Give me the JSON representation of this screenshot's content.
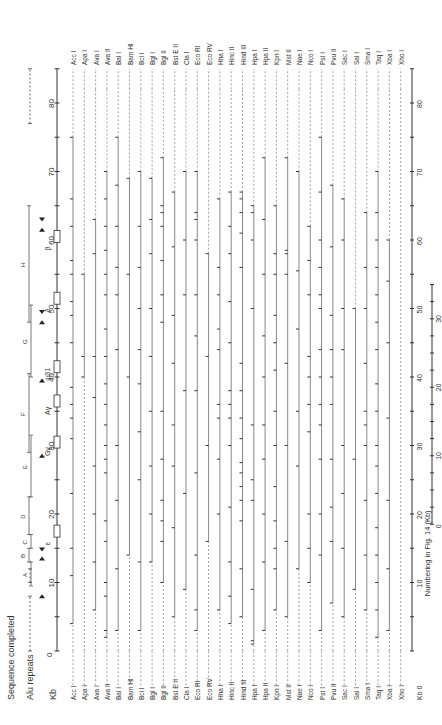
{
  "chart_data": {
    "type": "restriction_map",
    "orientation": "rotated-90-ccw",
    "title": "",
    "legend": {
      "sequence_completed": "Sequence completed",
      "alu_repeats": "Alu repeats"
    },
    "main_axis": {
      "label": "Kb",
      "zero_label": "0",
      "range": [
        0,
        85
      ],
      "ticks": [
        0,
        5,
        10,
        15,
        20,
        25,
        30,
        35,
        40,
        45,
        50,
        55,
        60,
        65,
        70,
        75,
        80,
        85
      ],
      "tick_labels": [
        "10",
        "20",
        "30",
        "40",
        "50",
        "60",
        "70",
        "80"
      ],
      "tick_label_values": [
        10,
        20,
        30,
        40,
        50,
        60,
        70,
        80
      ]
    },
    "secondary_axis": {
      "label": "Numbering in Fig. 14 (Kb)",
      "range": [
        0,
        35
      ],
      "tick_labels": [
        "0",
        "10",
        "20",
        "30"
      ],
      "tick_label_values": [
        0,
        10,
        20,
        30
      ],
      "offset_kb": 18.5
    },
    "sequenced_regions": [
      {
        "from": 0,
        "to": 8
      },
      {
        "from": 10,
        "to": 12
      },
      {
        "from": 77,
        "to": 85
      }
    ],
    "segments": [
      {
        "label": "A",
        "from": 9.5,
        "to": 13
      },
      {
        "label": "B",
        "from": 13,
        "to": 15
      },
      {
        "label": "C",
        "from": 15,
        "to": 17
      },
      {
        "label": "D",
        "from": 17,
        "to": 22.5
      },
      {
        "label": "E",
        "from": 22.5,
        "to": 31.5
      },
      {
        "label": "F",
        "from": 29,
        "to": 40.5
      },
      {
        "label": "G",
        "from": 40,
        "to": 50.5
      },
      {
        "label": "H",
        "from": 48,
        "to": 65
      }
    ],
    "genes": [
      {
        "label": "ε",
        "at": 17.5
      },
      {
        "label": "Gγ",
        "at": 30.5
      },
      {
        "label": "Aγ",
        "at": 36.5
      },
      {
        "label": "ψβ1",
        "at": 41.5
      },
      {
        "label": "δ",
        "at": 51.5
      },
      {
        "label": "β",
        "at": 60.5
      }
    ],
    "alu_arrows": [
      {
        "at": 8,
        "dir": "up"
      },
      {
        "at": 13.5,
        "dir": "up"
      },
      {
        "at": 14.8,
        "dir": "down"
      },
      {
        "at": 28.5,
        "dir": "up"
      },
      {
        "at": 39.5,
        "dir": "up"
      },
      {
        "at": 48,
        "dir": "up"
      },
      {
        "at": 49.5,
        "dir": "down"
      },
      {
        "at": 61.5,
        "dir": "up"
      },
      {
        "at": 63,
        "dir": "down"
      }
    ],
    "enzymes": [
      {
        "name": "Acc I",
        "mapped": [
          0,
          82
        ],
        "cuts": [
          4,
          11,
          15,
          23,
          31,
          34,
          36,
          38.5,
          45,
          49,
          51,
          55,
          57,
          62,
          66,
          75
        ]
      },
      {
        "name": "Apa I",
        "mapped": [
          0,
          82
        ],
        "cuts": [
          40,
          43,
          55
        ]
      },
      {
        "name": "Ava I",
        "mapped": [
          0,
          82
        ],
        "cuts": [
          6,
          13,
          20,
          27,
          37,
          43,
          58,
          63
        ]
      },
      {
        "name": "Ava II",
        "mapped": [
          0,
          82
        ],
        "cuts": [
          2,
          3,
          8,
          10,
          16,
          19,
          26,
          28,
          30,
          33,
          36,
          39,
          43,
          47,
          52,
          55,
          58.5,
          62,
          66,
          70
        ]
      },
      {
        "name": "Bal I",
        "mapped": [
          0,
          82
        ],
        "cuts": [
          3,
          12,
          22,
          30,
          44,
          52,
          56,
          62,
          68,
          75
        ]
      },
      {
        "name": "Bam HI",
        "mapped": [
          0,
          82
        ],
        "cuts": [
          14,
          40,
          55,
          69
        ]
      },
      {
        "name": "Bcl I",
        "mapped": [
          0,
          82
        ],
        "cuts": [
          3,
          13,
          25,
          32,
          39,
          44,
          50,
          56,
          62,
          70
        ]
      },
      {
        "name": "Bgl I",
        "mapped": [
          0,
          82
        ],
        "cuts": [
          13,
          20,
          27,
          35,
          43,
          50,
          58,
          63,
          69
        ]
      },
      {
        "name": "Bgl II",
        "mapped": [
          0,
          82
        ],
        "cuts": [
          10,
          16,
          19,
          22,
          28,
          35,
          48,
          52,
          57,
          62,
          64,
          65,
          72
        ]
      },
      {
        "name": "Bst E II",
        "mapped": [
          0,
          82
        ],
        "cuts": [
          5,
          18,
          27,
          33,
          42,
          49,
          59,
          67
        ]
      },
      {
        "name": "Cla I",
        "mapped": [
          0,
          82
        ],
        "cuts": [
          9,
          23,
          38,
          52,
          60,
          70
        ]
      },
      {
        "name": "Eco RI",
        "mapped": [
          0,
          82
        ],
        "cuts": [
          3,
          6,
          14,
          26,
          38,
          46,
          52,
          60,
          63,
          64,
          70
        ]
      },
      {
        "name": "Eco RV",
        "mapped": [
          0,
          82
        ],
        "cuts": [
          16,
          30,
          43,
          58
        ]
      },
      {
        "name": "Hha I",
        "mapped": [
          0,
          82
        ],
        "cuts": [
          6,
          20,
          28,
          34,
          36,
          44,
          47,
          52,
          56,
          66
        ]
      },
      {
        "name": "Hinc II",
        "mapped": [
          0,
          82
        ],
        "cuts": [
          4,
          8,
          13,
          21,
          30,
          34,
          36,
          38,
          45,
          51,
          58,
          62,
          67
        ]
      },
      {
        "name": "Hind III",
        "mapped": [
          0,
          82
        ],
        "cuts": [
          5,
          12,
          19,
          22,
          24,
          26,
          27.5,
          31,
          34,
          38,
          42,
          56,
          61,
          64,
          66,
          67
        ]
      },
      {
        "name": "Hpa I",
        "mapped": [
          0,
          82
        ],
        "cuts": [
          1,
          1.5,
          9,
          22,
          25,
          33,
          50,
          60,
          64,
          65
        ]
      },
      {
        "name": "Hpa II",
        "mapped": [
          0,
          82
        ],
        "cuts": [
          3,
          13,
          20,
          28,
          33,
          40,
          46,
          55,
          63,
          72
        ]
      },
      {
        "name": "Kpn I",
        "mapped": [
          0,
          82
        ],
        "cuts": [
          6,
          12,
          15,
          19,
          24,
          30,
          35,
          41,
          45,
          49,
          55,
          58,
          65
        ]
      },
      {
        "name": "Mst II",
        "mapped": [
          0,
          82
        ],
        "cuts": [
          5,
          16,
          30,
          42,
          55,
          58,
          58.5,
          72
        ]
      },
      {
        "name": "Nae I",
        "mapped": [
          0,
          82
        ],
        "cuts": [
          12,
          27,
          35,
          47,
          55.5,
          70
        ]
      },
      {
        "name": "Nco I",
        "mapped": [
          0,
          82
        ],
        "cuts": [
          10,
          15,
          20,
          32,
          36,
          40,
          43,
          52,
          57,
          62
        ]
      },
      {
        "name": "Pst I",
        "mapped": [
          0,
          82
        ],
        "cuts": [
          3,
          14,
          20,
          28,
          33,
          36,
          40,
          44,
          50,
          52,
          56,
          60,
          67,
          75
        ]
      },
      {
        "name": "Pvu II",
        "mapped": [
          0,
          82
        ],
        "cuts": [
          7,
          16,
          21,
          28,
          36,
          40,
          44,
          49,
          59,
          68
        ]
      },
      {
        "name": "Sac I",
        "mapped": [
          0,
          82
        ],
        "cuts": [
          5,
          15,
          23,
          30,
          44,
          50,
          60,
          66
        ]
      },
      {
        "name": "Sal I",
        "mapped": [
          0,
          82
        ],
        "cuts": [
          9,
          28,
          50
        ]
      },
      {
        "name": "Sma I",
        "mapped": [
          0,
          82
        ],
        "cuts": [
          6,
          14,
          22,
          30,
          33,
          35,
          42,
          50,
          56,
          64
        ]
      },
      {
        "name": "Taq I",
        "mapped": [
          0,
          82
        ],
        "cuts": [
          2,
          6,
          10,
          14,
          18,
          23,
          27,
          30,
          35,
          39,
          44,
          48,
          52,
          56,
          60,
          64,
          70
        ]
      },
      {
        "name": "Xba I",
        "mapped": [
          0,
          82
        ],
        "cuts": [
          3,
          12,
          22,
          34,
          45,
          54,
          60
        ]
      },
      {
        "name": "Xho I",
        "mapped": [
          0,
          82
        ],
        "cuts": []
      }
    ],
    "markers_note": "Filled dots beside some cut sites indicate polymorphic sites"
  },
  "labels": {
    "sequence_completed": "Sequence completed",
    "alu_repeats": "Alu repeats",
    "kb": "Kb",
    "zero": "0",
    "numbering": "Numbering in Fig. 14 (Kb)"
  }
}
